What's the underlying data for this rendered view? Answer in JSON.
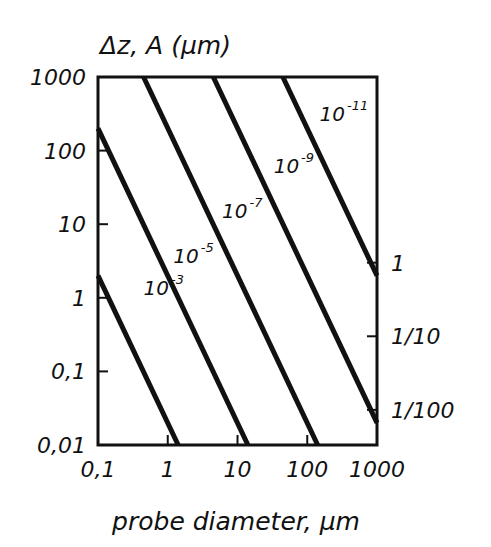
{
  "chart_data": {
    "type": "line",
    "title": "",
    "ylabel": "Δz, A (μm)",
    "xlabel": "probe diameter, μm",
    "xscale": "log",
    "yscale": "log",
    "xlim": [
      0.1,
      1000
    ],
    "ylim": [
      0.01,
      1000
    ],
    "x_ticks": [
      0.1,
      1,
      10,
      100,
      1000
    ],
    "x_tick_labels": [
      "0,1",
      "1",
      "10",
      "100",
      "1000"
    ],
    "y_ticks": [
      0.01,
      0.1,
      1,
      10,
      100,
      1000
    ],
    "y_tick_labels": [
      "0,01",
      "0,1",
      "1",
      "10",
      "100",
      "1000"
    ],
    "y2_ticks_in_left_units": [
      3.0,
      0.3,
      0.03
    ],
    "y2_tick_labels": [
      "1",
      "1/10",
      "1/100"
    ],
    "grid": false,
    "legend": "inline labels on lines",
    "series": [
      {
        "name": "10^-3",
        "base": "10",
        "exp": "-3",
        "slope": -2,
        "coef": 0.02,
        "label_at": [
          0.45,
          1.1
        ],
        "points": [
          [
            0.1,
            2
          ],
          [
            1.41,
            0.01
          ]
        ]
      },
      {
        "name": "10^-5",
        "base": "10",
        "exp": "-5",
        "slope": -2,
        "coef": 2,
        "label_at": [
          1.2,
          3.0
        ],
        "points": [
          [
            0.1,
            200
          ],
          [
            14.1,
            0.01
          ]
        ]
      },
      {
        "name": "10^-7",
        "base": "10",
        "exp": "-7",
        "slope": -2,
        "coef": 200,
        "label_at": [
          6.0,
          12
        ],
        "points": [
          [
            0.45,
            1000
          ],
          [
            141,
            0.01
          ]
        ]
      },
      {
        "name": "10^-9",
        "base": "10",
        "exp": "-9",
        "slope": -2,
        "coef": 20000,
        "label_at": [
          33,
          50
        ],
        "points": [
          [
            4.5,
            1000
          ],
          [
            1000,
            0.02
          ]
        ]
      },
      {
        "name": "10^-11",
        "base": "10",
        "exp": "-11",
        "slope": -2,
        "coef": 2000000,
        "label_at": [
          150,
          250
        ],
        "points": [
          [
            44.7,
            1000
          ],
          [
            1000,
            2
          ]
        ]
      }
    ]
  }
}
